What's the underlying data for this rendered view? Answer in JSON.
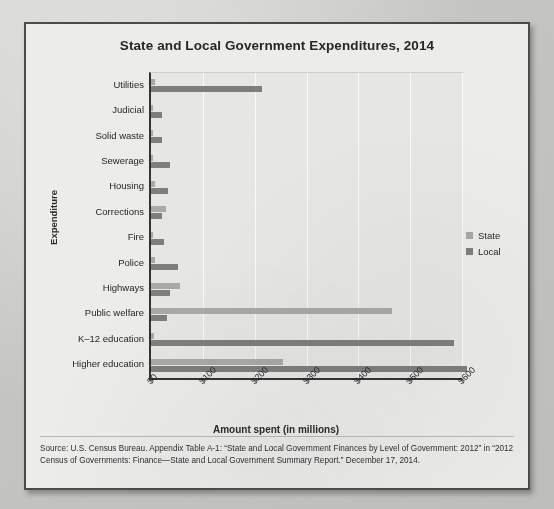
{
  "title": "State and Local Government Expenditures, 2014",
  "axes": {
    "y_title": "Expenditure",
    "x_title": "Amount spent (in millions)"
  },
  "legend": {
    "items": [
      {
        "label": "State",
        "color": "#a9a9a7"
      },
      {
        "label": "Local",
        "color": "#7e7e7c"
      }
    ]
  },
  "source": "Source: U.S. Census Bureau. Appendix Table A-1: “State and Local Government Finances by Level of Government: 2012” in “2012 Census of Governments: Finance—State and Local Government Summary Report.” December 17, 2014.",
  "chart_data": {
    "type": "bar",
    "orientation": "horizontal",
    "title": "State and Local Government Expenditures, 2014",
    "xlabel": "Amount spent (in millions)",
    "ylabel": "Expenditure",
    "xlim": [
      0,
      600
    ],
    "xticks": [
      "$0",
      "$100",
      "$200",
      "$300",
      "$400",
      "$500",
      "$600"
    ],
    "xtick_values": [
      0,
      100,
      200,
      300,
      400,
      500,
      600
    ],
    "grid": true,
    "legend_position": "right",
    "categories": [
      "Utilities",
      "Judicial",
      "Solid waste",
      "Sewerage",
      "Housing",
      "Corrections",
      "Fire",
      "Police",
      "Highways",
      "Public welfare",
      "K–12 education",
      "Higher education"
    ],
    "series": [
      {
        "name": "State",
        "color": "#a9a9a7",
        "values": [
          8,
          2,
          1,
          3,
          7,
          28,
          1,
          8,
          55,
          465,
          5,
          255
        ]
      },
      {
        "name": "Local",
        "color": "#7e7e7c",
        "values": [
          215,
          22,
          22,
          36,
          33,
          22,
          25,
          52,
          36,
          30,
          585,
          610
        ]
      }
    ]
  }
}
